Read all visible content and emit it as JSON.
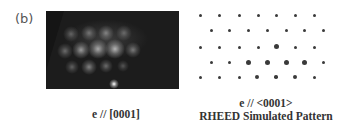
{
  "panel_label": "(b)",
  "experimental": {
    "caption": "e // [0001]",
    "spots": [
      {
        "x": 25,
        "y": 23,
        "r": 4,
        "a": 0.3
      },
      {
        "x": 43,
        "y": 22,
        "r": 4,
        "a": 0.35
      },
      {
        "x": 60,
        "y": 22,
        "r": 4,
        "a": 0.4
      },
      {
        "x": 78,
        "y": 22,
        "r": 4,
        "a": 0.3
      },
      {
        "x": 19,
        "y": 40,
        "r": 4,
        "a": 0.35
      },
      {
        "x": 35,
        "y": 39,
        "r": 4.5,
        "a": 0.55
      },
      {
        "x": 52,
        "y": 38,
        "r": 5,
        "a": 0.6
      },
      {
        "x": 69,
        "y": 38,
        "r": 5,
        "a": 0.65
      },
      {
        "x": 87,
        "y": 39,
        "r": 4,
        "a": 0.4
      },
      {
        "x": 26,
        "y": 56,
        "r": 3.5,
        "a": 0.3
      },
      {
        "x": 43,
        "y": 56,
        "r": 4,
        "a": 0.45
      },
      {
        "x": 60,
        "y": 55,
        "r": 3.5,
        "a": 0.35
      },
      {
        "x": 77,
        "y": 55,
        "r": 3,
        "a": 0.25
      },
      {
        "x": 68,
        "y": 73,
        "r": 2.5,
        "a": 1.0
      }
    ]
  },
  "simulated": {
    "caption_line1": "e // <0001>",
    "caption_line2": "RHEED Simulated Pattern",
    "dots": [
      {
        "x": 10,
        "y": 10,
        "s": 3
      },
      {
        "x": 29,
        "y": 10,
        "s": 3
      },
      {
        "x": 49,
        "y": 10,
        "s": 3
      },
      {
        "x": 68,
        "y": 10,
        "s": 3
      },
      {
        "x": 86,
        "y": 10,
        "s": 3
      },
      {
        "x": 105,
        "y": 10,
        "s": 3
      },
      {
        "x": 124,
        "y": 10,
        "s": 3
      },
      {
        "x": 21,
        "y": 25,
        "s": 3
      },
      {
        "x": 39,
        "y": 25,
        "s": 3
      },
      {
        "x": 58,
        "y": 25,
        "s": 3
      },
      {
        "x": 77,
        "y": 25,
        "s": 3
      },
      {
        "x": 96,
        "y": 25,
        "s": 3
      },
      {
        "x": 114,
        "y": 25,
        "s": 3
      },
      {
        "x": 133,
        "y": 25,
        "s": 3
      },
      {
        "x": 10,
        "y": 42,
        "s": 3
      },
      {
        "x": 29,
        "y": 42,
        "s": 3
      },
      {
        "x": 49,
        "y": 42,
        "s": 3
      },
      {
        "x": 68,
        "y": 42,
        "s": 3
      },
      {
        "x": 86,
        "y": 41,
        "s": 5
      },
      {
        "x": 105,
        "y": 42,
        "s": 3
      },
      {
        "x": 124,
        "y": 42,
        "s": 3
      },
      {
        "x": 21,
        "y": 57,
        "s": 3
      },
      {
        "x": 39,
        "y": 57,
        "s": 3
      },
      {
        "x": 58,
        "y": 57,
        "s": 5
      },
      {
        "x": 77,
        "y": 57,
        "s": 5
      },
      {
        "x": 96,
        "y": 57,
        "s": 5
      },
      {
        "x": 114,
        "y": 57,
        "s": 5
      },
      {
        "x": 133,
        "y": 57,
        "s": 3
      },
      {
        "x": 10,
        "y": 72,
        "s": 3
      },
      {
        "x": 29,
        "y": 72,
        "s": 3
      },
      {
        "x": 49,
        "y": 72,
        "s": 3
      },
      {
        "x": 67,
        "y": 72,
        "s": 4
      },
      {
        "x": 86,
        "y": 72,
        "s": 3.5
      },
      {
        "x": 105,
        "y": 72,
        "s": 4
      },
      {
        "x": 124,
        "y": 72,
        "s": 3
      }
    ]
  }
}
